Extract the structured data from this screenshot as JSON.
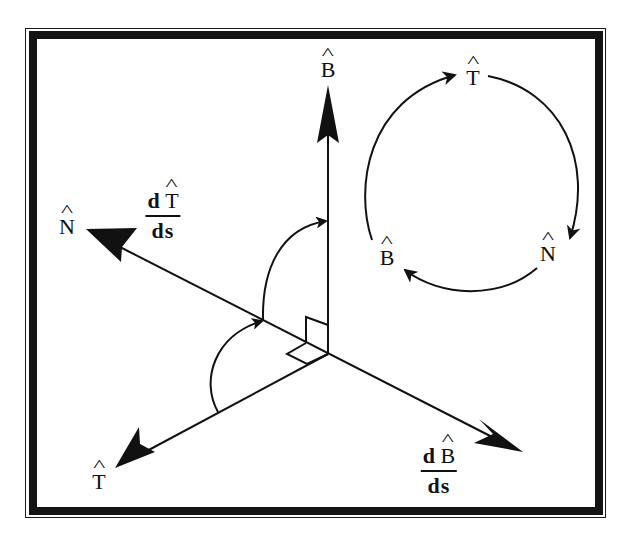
{
  "diagram": {
    "frame": {
      "border_color": "#141414",
      "background": "#ffffff"
    },
    "axes": {
      "binormal": {
        "label": "B",
        "hat": true
      },
      "normal": {
        "label": "N",
        "hat": true
      },
      "tangent": {
        "label": "T",
        "hat": true
      }
    },
    "derivatives": {
      "dT_ds": {
        "numerator_d": "d",
        "numerator_vec": "T",
        "denominator": "ds"
      },
      "dB_ds": {
        "numerator_d": "d",
        "numerator_vec": "B",
        "denominator": "ds"
      }
    },
    "cycle": {
      "nodes": [
        {
          "label": "T",
          "hat": true
        },
        {
          "label": "N",
          "hat": true
        },
        {
          "label": "B",
          "hat": true
        }
      ],
      "direction": "clockwise"
    },
    "colors": {
      "ink": "#111111",
      "paper": "#ffffff"
    }
  }
}
